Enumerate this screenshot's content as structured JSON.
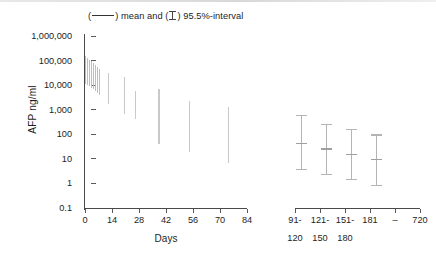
{
  "figure": {
    "legend_prefix": "(",
    "legend_mid": ") mean and (",
    "legend_suffix": ") 95.5%-interval",
    "y_axis_title": "AFP ng/ml",
    "x_axis_title": "Days"
  },
  "chart_data": {
    "type": "line",
    "xlabel": "Days",
    "ylabel": "AFP ng/ml",
    "yscale": "log",
    "ylim": [
      0.1,
      1000000
    ],
    "ytick_labels": [
      "1,000,000",
      "100,000",
      "10,000",
      "1,000",
      "100",
      "10",
      "1",
      "0.1"
    ],
    "ytick_values": [
      1000000,
      100000,
      10000,
      1000,
      100,
      10,
      1,
      0.1
    ],
    "grid": false,
    "legend_position": "top",
    "panels": [
      {
        "name": "days-panel",
        "xlim": [
          0,
          84
        ],
        "xtick_labels": [
          "0",
          "14",
          "28",
          "42",
          "56",
          "70",
          "84"
        ],
        "xtick_values": [
          0,
          14,
          28,
          42,
          56,
          70,
          84
        ],
        "series": [
          {
            "name": "95.5%-interval",
            "x": [
              0,
              1,
              2,
              3,
              4,
              5,
              6,
              7,
              12,
              20,
              26,
              38,
              54,
              74
            ],
            "ci_upper": [
              150000,
              130000,
              110000,
              95000,
              80000,
              68000,
              55000,
              45000,
              30000,
              22000,
              6000,
              7000,
              2300,
              1300
            ],
            "ci_lower": [
              11000,
              10000,
              9000,
              8000,
              7000,
              6000,
              5000,
              4000,
              1700,
              650,
              400,
              40,
              19,
              7
            ]
          }
        ]
      },
      {
        "name": "months-panel",
        "categories": [
          "91-120",
          "121-150",
          "151-180",
          "181 – 720"
        ],
        "xtick_labels_top": [
          "91-",
          "121-",
          "151-",
          "181",
          "–",
          "720"
        ],
        "xtick_labels_bottom": [
          "120",
          "150",
          "180"
        ],
        "series": [
          {
            "name": "mean",
            "values": [
              45,
              27,
              16,
              10
            ]
          },
          {
            "name": "95.5%-interval",
            "ci_upper": [
              620,
              260,
              170,
              100
            ],
            "ci_lower": [
              3.8,
              2.4,
              1.5,
              0.9
            ]
          }
        ]
      }
    ]
  },
  "colors": {
    "axis": "#4a4a4a",
    "bars": "#c9c9c9",
    "errorbars": "#b4b4b4",
    "text": "#1d1d1d"
  }
}
